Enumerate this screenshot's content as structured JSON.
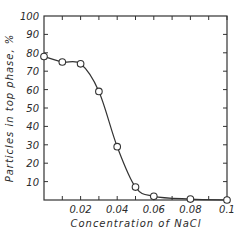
{
  "chart_data": {
    "type": "line",
    "title": "",
    "xlabel": "Concentration of NaCl",
    "ylabel": "Particles in top phase, %",
    "xlim": [
      0,
      0.1
    ],
    "ylim": [
      0,
      100
    ],
    "grid": false,
    "legend": null,
    "x_ticks": [
      0.02,
      0.04,
      0.06,
      0.08,
      0.1
    ],
    "x_tick_labels": [
      "0.02",
      "0.04",
      "0.06",
      "0.08",
      "0.1"
    ],
    "y_ticks": [
      10,
      20,
      30,
      40,
      50,
      60,
      70,
      80,
      90,
      100
    ],
    "y_tick_labels": [
      "10",
      "20",
      "30",
      "40",
      "50",
      "60",
      "70",
      "80",
      "90",
      "100"
    ],
    "marker": "open-circle",
    "series": [
      {
        "name": "Particles in top phase",
        "x": [
          0,
          0.01,
          0.02,
          0.03,
          0.04,
          0.05,
          0.06,
          0.08,
          0.1
        ],
        "y": [
          78,
          75,
          74,
          59,
          29,
          7,
          2,
          0.5,
          0
        ]
      }
    ]
  }
}
